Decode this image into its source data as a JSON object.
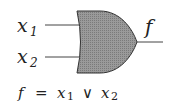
{
  "diagram": {
    "type": "logic-gate",
    "gate": "OR",
    "inputs": [
      {
        "name": "x",
        "sub": "1"
      },
      {
        "name": "x",
        "sub": "2"
      }
    ],
    "output": {
      "name": "f"
    },
    "formula": {
      "lhs": "f",
      "eq": "=",
      "terms": [
        {
          "name": "x",
          "sub": "1"
        },
        {
          "op": "∨"
        },
        {
          "name": "x",
          "sub": "2"
        }
      ]
    },
    "colors": {
      "gate_fill": "#8a8a8a",
      "stroke": "#333333",
      "text": "#222222"
    }
  }
}
